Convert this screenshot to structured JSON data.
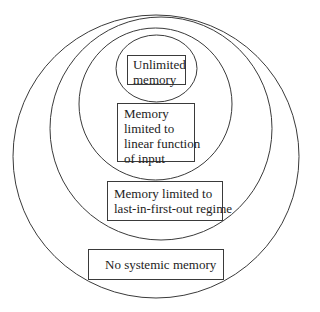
{
  "diagram": {
    "type": "nested-ellipses",
    "stroke_color": "#3a3a3a",
    "background": "#ffffff",
    "levels": [
      {
        "id": "none",
        "label_lines": [
          "No systemic memory"
        ],
        "ellipse": {
          "cx": 156,
          "cy": 156.5,
          "rx": 143,
          "ry": 141.5
        }
      },
      {
        "id": "lifo",
        "label_lines": [
          "Memory limited to",
          "last-in-first-out regime"
        ],
        "ellipse": {
          "cx": 161,
          "cy": 128.5,
          "rx": 111,
          "ry": 111.5
        }
      },
      {
        "id": "linear",
        "label_lines": [
          "Memory",
          "limited to",
          "linear function",
          "of input"
        ],
        "ellipse": {
          "cx": 155.5,
          "cy": 104,
          "rx": 76.5,
          "ry": 76
        }
      },
      {
        "id": "unlimited",
        "label_lines": [
          "Unlimited",
          "memory"
        ],
        "ellipse": {
          "cx": 156.5,
          "cy": 68.5,
          "rx": 40.5,
          "ry": 33.5
        }
      }
    ]
  }
}
